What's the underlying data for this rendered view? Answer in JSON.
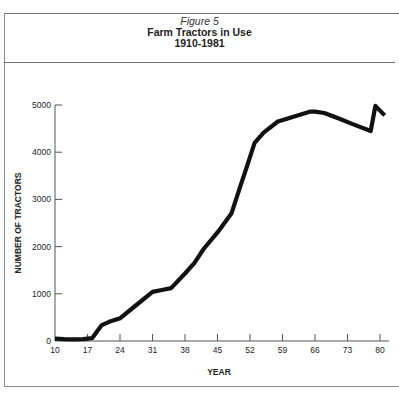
{
  "figure": {
    "label": "Figure 5",
    "title": "Farm Tractors in Use",
    "subtitle": "1910-1981"
  },
  "chart_data": {
    "type": "line",
    "title": "Farm Tractors in Use",
    "subtitle": "1910-1981",
    "figure_label": "Figure 5",
    "xlabel": "YEAR",
    "ylabel": "NUMBER OF TRACTORS",
    "x_ticks": [
      "10",
      "17",
      "24",
      "31",
      "38",
      "45",
      "52",
      "59",
      "66",
      "73",
      "80"
    ],
    "y_ticks": [
      "0",
      "1000",
      "2000",
      "3000",
      "4000",
      "5000"
    ],
    "xlim": [
      10,
      82
    ],
    "ylim": [
      0,
      5000
    ],
    "grid": false,
    "legend": null,
    "series": [
      {
        "name": "Farm tractors in use",
        "x": [
          10,
          12,
          14,
          16,
          18,
          20,
          22,
          24,
          27,
          31,
          33,
          35,
          38,
          40,
          42,
          45,
          48,
          50,
          51,
          53,
          55,
          58,
          61,
          64,
          65,
          66,
          68,
          71,
          74,
          78,
          79,
          81
        ],
        "values": [
          50,
          40,
          35,
          40,
          60,
          330,
          420,
          480,
          720,
          1040,
          1080,
          1120,
          1430,
          1650,
          1950,
          2300,
          2700,
          3300,
          3600,
          4200,
          4420,
          4650,
          4740,
          4830,
          4860,
          4860,
          4830,
          4720,
          4600,
          4450,
          4980,
          4780
        ]
      }
    ]
  }
}
